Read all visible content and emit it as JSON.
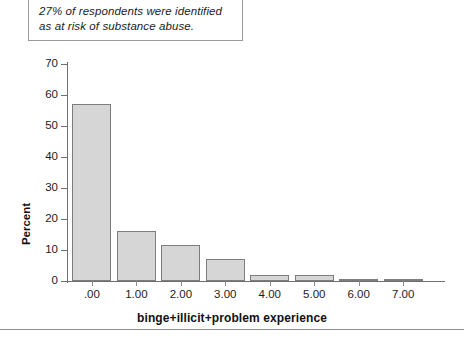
{
  "callout": {
    "lines": [
      "27% of respondents were identified",
      "as at risk of substance abuse."
    ]
  },
  "chart_data": {
    "type": "bar",
    "title": "",
    "xlabel": "binge+illicit+problem experience",
    "ylabel": "Percent",
    "categories": [
      ".00",
      "1.00",
      "2.00",
      "3.00",
      "4.00",
      "5.00",
      "6.00",
      "7.00"
    ],
    "values": [
      57,
      16,
      11.5,
      7,
      2,
      1.8,
      0.6,
      0.6
    ],
    "ylim": [
      0,
      70
    ],
    "yticks": [
      "0",
      "10",
      "20",
      "30",
      "40",
      "50",
      "60",
      "70"
    ],
    "ytick_values": [
      0,
      10,
      20,
      30,
      40,
      50,
      60,
      70
    ],
    "grid": false,
    "legend": "none",
    "bar_color": "#d6d6d6",
    "bar_edge_color": "#7d7d7d",
    "axis_color": "#6f6f6f"
  }
}
